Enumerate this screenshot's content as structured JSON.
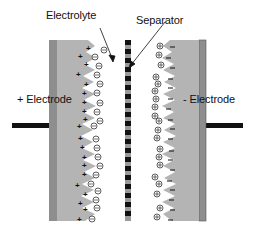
{
  "diagram": {
    "type": "electrochemical double-layer capacitor schematic",
    "labels": {
      "electrolyte": "Electrolyte",
      "separator": "Separator",
      "positive_electrode": "+ Electrode",
      "negative_electrode": "- Electrode"
    },
    "colors": {
      "electrode_fill": "#b4b4b4",
      "current_collector": "#8e8e8e",
      "lead": "#111111",
      "separator_block": "#111111",
      "separator_gap": "#9a9a9a",
      "text": "#111111"
    },
    "symbols": {
      "positive_charge": "+",
      "negative_ion": "⊖",
      "positive_ion": "⊕",
      "negative_charge": "−"
    }
  }
}
